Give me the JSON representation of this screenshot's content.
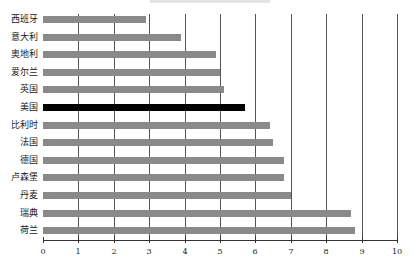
{
  "chart_data": {
    "type": "bar",
    "orientation": "horizontal",
    "title": "",
    "xlabel": "",
    "ylabel": "",
    "xlim": [
      0,
      10
    ],
    "xticks": [
      0,
      1,
      2,
      3,
      4,
      5,
      6,
      7,
      8,
      9,
      10
    ],
    "grid": "vertical",
    "categories": [
      "西班牙",
      "意大利",
      "奥地利",
      "爱尔兰",
      "英国",
      "美国",
      "比利时",
      "法国",
      "德国",
      "卢森堡",
      "丹麦",
      "瑞典",
      "荷兰"
    ],
    "values": [
      2.9,
      3.9,
      4.9,
      5.0,
      5.1,
      5.7,
      6.4,
      6.5,
      6.8,
      6.8,
      7.0,
      8.7,
      8.8
    ],
    "highlight": "美国",
    "colors": {
      "bar": "#8a8a8a",
      "highlight": "#000000",
      "grid": "#555555"
    }
  }
}
